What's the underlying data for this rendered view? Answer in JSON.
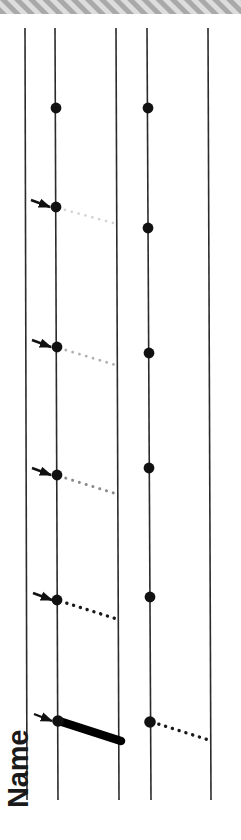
{
  "figure": {
    "width": 241,
    "height": 840,
    "background_color": "#ffffff",
    "axis_label": "Name",
    "axis_label_orientation": "vertical-bottom-up",
    "top_band": {
      "name": "hatched-header-band",
      "y": 0,
      "height": 14,
      "fill_color": "#d8d8d8",
      "hatch_color": "#a8a8a8",
      "hatch_angle_deg": 45
    },
    "vertical_lines": [
      {
        "id": "line-1",
        "label": "1",
        "x_top": 25,
        "x_bottom": 27,
        "y_top": 28,
        "y_bottom": 800,
        "color": "#2b2b2b",
        "width": 1.6
      },
      {
        "id": "line-2",
        "label": "2",
        "x_top": 55,
        "x_bottom": 58,
        "y_top": 28,
        "y_bottom": 800,
        "color": "#2b2b2b",
        "width": 1.6
      },
      {
        "id": "line-3",
        "label": "3",
        "x_top": 116,
        "x_bottom": 119,
        "y_top": 28,
        "y_bottom": 800,
        "color": "#2b2b2b",
        "width": 1.6
      },
      {
        "id": "line-4",
        "label": "4",
        "x_top": 147,
        "x_bottom": 151,
        "y_top": 28,
        "y_bottom": 800,
        "color": "#2b2b2b",
        "width": 1.6
      },
      {
        "id": "line-5",
        "label": "5",
        "x_top": 208,
        "x_bottom": 211,
        "y_top": 28,
        "y_bottom": 800,
        "color": "#2b2b2b",
        "width": 1.6
      }
    ],
    "nodes": [
      {
        "id": "node-a2",
        "on_line": "line-2",
        "x": 56,
        "y": 108,
        "radius": 5.4,
        "color": "#111111"
      },
      {
        "id": "node-a4",
        "on_line": "line-4",
        "x": 148,
        "y": 108,
        "radius": 5.4,
        "color": "#111111"
      },
      {
        "id": "node-b2",
        "on_line": "line-2",
        "x": 56,
        "y": 207,
        "radius": 5.4,
        "color": "#111111"
      },
      {
        "id": "node-b4",
        "on_line": "line-4",
        "x": 148,
        "y": 228,
        "radius": 5.4,
        "color": "#111111"
      },
      {
        "id": "node-c2",
        "on_line": "line-2",
        "x": 57,
        "y": 347,
        "radius": 5.4,
        "color": "#111111"
      },
      {
        "id": "node-c4",
        "on_line": "line-4",
        "x": 149,
        "y": 353,
        "radius": 5.4,
        "color": "#111111"
      },
      {
        "id": "node-d2",
        "on_line": "line-2",
        "x": 57,
        "y": 475,
        "radius": 5.4,
        "color": "#111111"
      },
      {
        "id": "node-d4",
        "on_line": "line-4",
        "x": 149,
        "y": 468,
        "radius": 5.4,
        "color": "#111111"
      },
      {
        "id": "node-e2",
        "on_line": "line-2",
        "x": 57,
        "y": 600,
        "radius": 5.4,
        "color": "#111111"
      },
      {
        "id": "node-e4",
        "on_line": "line-4",
        "x": 150,
        "y": 597,
        "radius": 5.4,
        "color": "#111111"
      },
      {
        "id": "node-f2",
        "on_line": "line-2",
        "x": 58,
        "y": 721,
        "radius": 5.8,
        "color": "#111111"
      },
      {
        "id": "node-f4",
        "on_line": "line-4",
        "x": 150,
        "y": 722,
        "radius": 5.8,
        "color": "#111111"
      }
    ],
    "connectors": [
      {
        "id": "connector-1",
        "style": "dotted",
        "intensity_label": "very-faint",
        "color": "#d2d2d2",
        "width": 2.6,
        "dash": "0.1 7",
        "x1": 58,
        "y1": 208,
        "x2": 117,
        "y2": 224
      },
      {
        "id": "connector-2",
        "style": "dotted",
        "intensity_label": "faint",
        "color": "#b0b0b0",
        "width": 2.8,
        "dash": "0.1 7",
        "x1": 59,
        "y1": 348,
        "x2": 119,
        "y2": 366
      },
      {
        "id": "connector-3",
        "style": "dotted",
        "intensity_label": "medium",
        "color": "#8a8a8a",
        "width": 3.0,
        "dash": "0.1 7",
        "x1": 59,
        "y1": 476,
        "x2": 120,
        "y2": 495
      },
      {
        "id": "connector-4",
        "style": "dotted",
        "intensity_label": "dark",
        "color": "#1a1a1a",
        "width": 3.4,
        "dash": "0.1 7",
        "x1": 60,
        "y1": 601,
        "x2": 120,
        "y2": 620
      },
      {
        "id": "connector-5",
        "style": "solid-thick",
        "intensity_label": "solid",
        "color": "#000000",
        "width": 8.5,
        "dash": "none",
        "x1": 59,
        "y1": 721,
        "x2": 121,
        "y2": 741
      },
      {
        "id": "connector-6",
        "style": "dotted",
        "intensity_label": "dark",
        "color": "#1a1a1a",
        "width": 3.4,
        "dash": "0.1 7",
        "x1": 152,
        "y1": 722,
        "x2": 212,
        "y2": 741
      }
    ],
    "arrows": [
      {
        "id": "arrow-1",
        "points_to": "node-b2",
        "x_tail": 31,
        "y_tail": 200,
        "x_tip": 50,
        "y_tip": 207,
        "color": "#111111"
      },
      {
        "id": "arrow-2",
        "points_to": "node-c2",
        "x_tail": 32,
        "y_tail": 340,
        "x_tip": 51,
        "y_tip": 347,
        "color": "#111111"
      },
      {
        "id": "arrow-3",
        "points_to": "node-d2",
        "x_tail": 32,
        "y_tail": 468,
        "x_tip": 51,
        "y_tip": 475,
        "color": "#111111"
      },
      {
        "id": "arrow-4",
        "points_to": "node-e2",
        "x_tail": 33,
        "y_tail": 593,
        "x_tip": 52,
        "y_tip": 600,
        "color": "#111111"
      },
      {
        "id": "arrow-5",
        "points_to": "node-f2",
        "x_tail": 34,
        "y_tail": 714,
        "x_tip": 52,
        "y_tip": 721,
        "color": "#111111"
      }
    ]
  }
}
